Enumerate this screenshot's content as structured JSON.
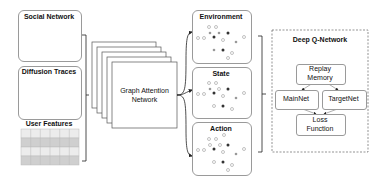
{
  "inputs": {
    "social_network": {
      "label": "Social Network"
    },
    "diffusion_traces": {
      "label": "Diffusion Traces"
    },
    "user_features": {
      "label": "User Features",
      "grid_rows": 4,
      "grid_cols": 6
    }
  },
  "gat": {
    "label_line1": "Graph Attention",
    "label_line2": "Network",
    "stack_layers": 5
  },
  "rl": {
    "environment": {
      "label": "Environment"
    },
    "state": {
      "label": "State"
    },
    "action": {
      "label": "Action"
    }
  },
  "dqn": {
    "title": "Deep Q-Network",
    "replay_memory": {
      "line1": "Replay",
      "line2": "Memory"
    },
    "mainnet": {
      "label": "MainNet"
    },
    "targetnet": {
      "label": "TargetNet"
    },
    "loss": {
      "line1": "Loss",
      "line2": "Function"
    }
  },
  "colors": {
    "dark_node": "#333333",
    "gray_node": "#9a9a9a",
    "grid_dark": "#cfcfcf",
    "grid_light": "#ececec",
    "border": "#9a9a9a"
  }
}
